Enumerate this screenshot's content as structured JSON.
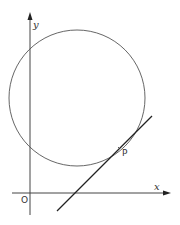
{
  "diagram": {
    "axes": {
      "x_label": "x",
      "y_label": "y",
      "origin_label": "O"
    },
    "circle": {
      "center": [
        77,
        98
      ],
      "radius": 68
    },
    "tangent_line": {
      "from": [
        57,
        211
      ],
      "to": [
        152,
        116
      ]
    },
    "point": {
      "label": "P",
      "position": [
        127,
        141
      ]
    },
    "colors": {
      "stroke": "#444444",
      "line": "#222222"
    }
  }
}
